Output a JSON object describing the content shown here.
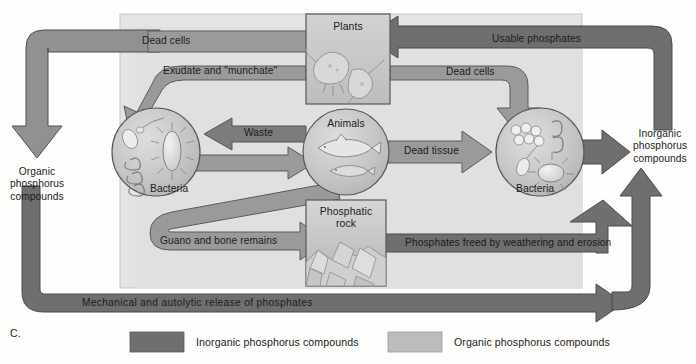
{
  "figure": {
    "caption_letter": "C."
  },
  "pools": {
    "organic": "Organic\nphosphorus\ncompounds",
    "organic_line1": "Organic",
    "organic_line2": "phosphorus",
    "organic_line3": "compounds",
    "inorganic_line1": "Inorganic",
    "inorganic_line2": "phosphorus",
    "inorganic_line3": "compounds"
  },
  "nodes": [
    {
      "id": "plants",
      "label": "Plants",
      "shape": "box",
      "art": "phytoplankton-illustration"
    },
    {
      "id": "animals",
      "label": "Animals",
      "shape": "circle",
      "art": "fish-illustration"
    },
    {
      "id": "bacteria_left",
      "label": "Bacteria",
      "shape": "circle",
      "art": "bacteria-illustration"
    },
    {
      "id": "bacteria_right",
      "label": "Bacteria",
      "shape": "circle",
      "art": "bacteria-illustration"
    },
    {
      "id": "rock",
      "label_line1": "Phosphatic",
      "label_line2": "rock",
      "shape": "box",
      "art": "rock-illustration"
    }
  ],
  "flows": [
    {
      "id": "dead-cells-left",
      "label": "Dead cells",
      "from": "plants",
      "to": "organic-pool",
      "kind": "organic"
    },
    {
      "id": "exudate",
      "label": "Exudate and \"munchate\"",
      "from": "plants",
      "to": "bacteria_left",
      "kind": "organic"
    },
    {
      "id": "waste",
      "label": "Waste",
      "from": "animals",
      "to": "bacteria_left",
      "kind": "organic"
    },
    {
      "id": "bacteria-to-animals",
      "label": "",
      "from": "bacteria_left",
      "to": "animals",
      "kind": "organic"
    },
    {
      "id": "dead-tissue",
      "label": "Dead tissue",
      "from": "animals",
      "to": "bacteria_right",
      "kind": "organic"
    },
    {
      "id": "dead-cells-right",
      "label": "Dead cells",
      "from": "plants",
      "to": "bacteria_right",
      "kind": "organic"
    },
    {
      "id": "guano",
      "label": "Guano and bone remains",
      "from": "animals",
      "to": "rock",
      "kind": "organic"
    },
    {
      "id": "usable-phosphates",
      "label": "Usable phosphates",
      "from": "inorganic-pool",
      "to": "plants",
      "kind": "inorganic"
    },
    {
      "id": "weathering",
      "label": "Phosphates freed by weathering and erosion",
      "from": "rock",
      "to": "inorganic-pool",
      "kind": "inorganic"
    },
    {
      "id": "mechanical",
      "label": "Mechanical and autolytic release of phosphates",
      "from": "organic-pool",
      "to": "inorganic-pool",
      "kind": "inorganic"
    },
    {
      "id": "bacteria-release",
      "label": "",
      "from": "bacteria_right",
      "to": "inorganic-pool",
      "kind": "inorganic"
    }
  ],
  "legend": {
    "items": [
      {
        "id": "inorganic",
        "label": "Inorganic phosphorus compounds",
        "color": "#6f6f6f"
      },
      {
        "id": "organic",
        "label": "Organic phosphorus compounds",
        "color": "#bcbcbc"
      }
    ]
  },
  "colors": {
    "inorganic_arrow": "#6f6f6f",
    "organic_arrow": "#999999",
    "organic_panel": "#e2e2e2",
    "node_fill": "#c9c9c9",
    "outline": "#555555",
    "text": "#1b1b1b",
    "page_bg": "#fefefc"
  }
}
